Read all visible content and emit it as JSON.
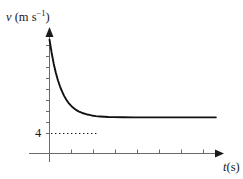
{
  "figure": {
    "background_color": "#ffffff",
    "ink_color": "#1a1a1a",
    "axis_color": "#5a5a5a",
    "width": 243,
    "height": 179
  },
  "labels": {
    "y_axis": {
      "quantity": "v",
      "open_paren": " (m s",
      "exponent": "−1",
      "close_paren": ")",
      "full_text": "v (m s−1)"
    },
    "x_axis": {
      "quantity": "t",
      "units": "(s)",
      "full_text": "t(s)"
    },
    "y_tick": "4"
  },
  "chart_data": {
    "type": "line",
    "title": "",
    "xlabel": "t(s)",
    "ylabel": "v (m s−1)",
    "grid": false,
    "legend": null,
    "xlim": [
      0,
      8
    ],
    "ylim": [
      0,
      13
    ],
    "y_tick_labels": [
      "4"
    ],
    "y_tick_values": [
      4
    ],
    "x_tick_labels": [],
    "x_tick_count": 8,
    "asymptote": {
      "value": 4,
      "style": "dotted",
      "label": "4",
      "x_start": 0,
      "x_end": 2.1
    },
    "series": [
      {
        "name": "velocity",
        "description": "exponential decay to terminal velocity 4 m s^-1",
        "model": "v = 4 + 8.6 * exp(-1.85 t)",
        "x": [
          0.0,
          0.1,
          0.2,
          0.3,
          0.4,
          0.5,
          0.6,
          0.7,
          0.8,
          0.9,
          1.0,
          1.1,
          1.2,
          1.3,
          1.4,
          1.5,
          1.6,
          1.7,
          1.8,
          1.9,
          2.0,
          2.2,
          2.4,
          2.6,
          2.8,
          3.0,
          3.5,
          4.0,
          4.5,
          5.0,
          5.5,
          6.0,
          6.5,
          7.0,
          7.5,
          7.9
        ],
        "y": [
          12.6,
          11.15,
          9.94,
          8.94,
          8.11,
          7.41,
          6.84,
          6.35,
          5.95,
          5.61,
          5.35,
          5.11,
          4.93,
          4.77,
          4.64,
          4.54,
          4.45,
          4.38,
          4.31,
          4.27,
          4.21,
          4.14,
          4.1,
          4.07,
          4.04,
          4.03,
          4.01,
          4.0,
          4.0,
          4.0,
          4.0,
          4.0,
          4.0,
          4.0,
          4.0,
          4.0
        ]
      }
    ]
  }
}
